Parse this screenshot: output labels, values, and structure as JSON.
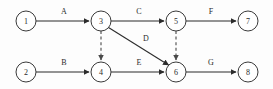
{
  "diagram": {
    "type": "activity-network-diagram",
    "background_color": "#fdfdfd",
    "stroke_color": "#2b2b2b",
    "node_fill": "#ffffff",
    "nodes": [
      {
        "id": "1",
        "label": "1",
        "cx": 26,
        "cy": 21,
        "r": 10
      },
      {
        "id": "2",
        "label": "2",
        "cx": 26,
        "cy": 72,
        "r": 10
      },
      {
        "id": "3",
        "label": "3",
        "cx": 101,
        "cy": 21,
        "r": 10
      },
      {
        "id": "4",
        "label": "4",
        "cx": 101,
        "cy": 72,
        "r": 10
      },
      {
        "id": "5",
        "label": "5",
        "cx": 176,
        "cy": 21,
        "r": 10
      },
      {
        "id": "6",
        "label": "6",
        "cx": 176,
        "cy": 72,
        "r": 10
      },
      {
        "id": "7",
        "label": "7",
        "cx": 248,
        "cy": 21,
        "r": 10
      },
      {
        "id": "8",
        "label": "8",
        "cx": 248,
        "cy": 72,
        "r": 10
      }
    ],
    "edges": [
      {
        "id": "edge-a",
        "label": "A",
        "from": "1",
        "to": "3",
        "style": "solid",
        "label_x": 64,
        "label_y": 11
      },
      {
        "id": "edge-b",
        "label": "B",
        "from": "2",
        "to": "4",
        "style": "solid",
        "label_x": 64,
        "label_y": 62
      },
      {
        "id": "edge-c",
        "label": "C",
        "from": "3",
        "to": "5",
        "style": "solid",
        "label_x": 139,
        "label_y": 11
      },
      {
        "id": "edge-d",
        "label": "D",
        "from": "3",
        "to": "6",
        "style": "solid",
        "label_x": 146,
        "label_y": 38
      },
      {
        "id": "edge-e",
        "label": "E",
        "from": "4",
        "to": "6",
        "style": "solid",
        "label_x": 139,
        "label_y": 62
      },
      {
        "id": "edge-f",
        "label": "F",
        "from": "5",
        "to": "7",
        "style": "solid",
        "label_x": 211,
        "label_y": 11
      },
      {
        "id": "edge-g",
        "label": "G",
        "from": "6",
        "to": "8",
        "style": "solid",
        "label_x": 211,
        "label_y": 62
      },
      {
        "id": "edge-dummy-34",
        "label": "",
        "from": "3",
        "to": "4",
        "style": "dashed",
        "label_x": null,
        "label_y": null
      },
      {
        "id": "edge-dummy-56",
        "label": "",
        "from": "5",
        "to": "6",
        "style": "dashed",
        "label_x": null,
        "label_y": null
      }
    ]
  }
}
